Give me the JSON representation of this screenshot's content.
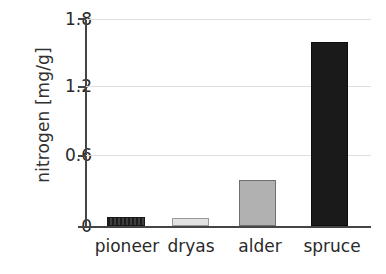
{
  "chart_data": {
    "type": "bar",
    "title": "",
    "xlabel": "",
    "ylabel": "nitrogen [mg/g]",
    "categories": [
      "pioneer",
      "dryas",
      "alder",
      "spruce"
    ],
    "values": [
      0.08,
      0.07,
      0.4,
      1.6
    ],
    "series": [
      {
        "name": "nitrogen",
        "values": [
          0.08,
          0.07,
          0.4,
          1.6
        ]
      }
    ],
    "ylim": [
      0,
      1.8
    ],
    "yticks": [
      0,
      0.6,
      1.2,
      1.8
    ],
    "ytick_labels": [
      "0",
      "0.6",
      "1.2",
      "1.8"
    ],
    "grid": true,
    "grid_axis": "y",
    "legend": false,
    "legend_position": "none",
    "bar_styles": [
      {
        "category": "pioneer",
        "fill": "#272727",
        "pattern": "vertical-stripes",
        "edge": "#191919"
      },
      {
        "category": "dryas",
        "fill": "#e2e2e2",
        "pattern": "solid",
        "edge": "#9a9a9a"
      },
      {
        "category": "alder",
        "fill": "#b1b1b1",
        "pattern": "solid",
        "edge": "#6f6f6f"
      },
      {
        "category": "spruce",
        "fill": "#1a1a1a",
        "pattern": "solid",
        "edge": "#0d0d0d"
      }
    ],
    "colors": {
      "background": "#ffffff",
      "axis": "#454545",
      "gridline": "#dedede",
      "text": "#2a2a2a"
    }
  }
}
